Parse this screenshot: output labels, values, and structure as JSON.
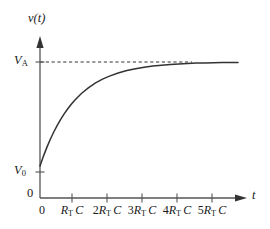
{
  "figure": {
    "background_color": "#ffffff",
    "line_color": "#333333",
    "text_color": "#1a1a1a"
  },
  "axes": {
    "y_axis_label": "v(t)",
    "x_axis_label": "t",
    "y_axis_name": "y-axis",
    "x_axis_name": "x-axis",
    "origin_label": "0",
    "origin_label_x": "0"
  },
  "y_ticks": [
    {
      "label_base": "V",
      "label_sub": "A",
      "value": "V_A"
    },
    {
      "label_base": "V",
      "label_sub": "0",
      "value": "V_0"
    }
  ],
  "x_ticks": [
    {
      "coef": "",
      "base": "R",
      "sub": "T",
      "unit": "C",
      "label": "R_T C"
    },
    {
      "coef": "2",
      "base": "R",
      "sub": "T",
      "unit": "C",
      "label": "2R_T C"
    },
    {
      "coef": "3",
      "base": "R",
      "sub": "T",
      "unit": "C",
      "label": "3R_T C"
    },
    {
      "coef": "4",
      "base": "R",
      "sub": "T",
      "unit": "C",
      "label": "4R_T C"
    },
    {
      "coef": "5",
      "base": "R",
      "sub": "T",
      "unit": "C",
      "label": "5R_T C"
    }
  ],
  "chart_data": {
    "type": "line",
    "title": "",
    "subtitle": "",
    "xlabel": "t",
    "ylabel": "v(t)",
    "xlim": [
      0,
      5.7
    ],
    "ylim": [
      0,
      1.22
    ],
    "grid": false,
    "legend": null,
    "x_tick_values": [
      0,
      1,
      2,
      3,
      4,
      5
    ],
    "x_tick_labels": [
      "0",
      "R_T C",
      "2R_T C",
      "3R_T C",
      "4R_T C",
      "5R_T C"
    ],
    "y_tick_values": [
      0,
      0.235,
      1.0
    ],
    "y_tick_labels": [
      "0",
      "V_0",
      "V_A"
    ],
    "annotations": [
      {
        "name": "asymptote",
        "type": "dashed-horizontal-line",
        "y": 1.0,
        "x_start": 0,
        "x_end": 4.3,
        "label": "V_A"
      }
    ],
    "series": [
      {
        "name": "v(t) = V_A + (V_0 - V_A) e^(-t / R_T C)",
        "style": "solid",
        "color": "#333333",
        "x": [
          0,
          0.1,
          0.2,
          0.3,
          0.4,
          0.5,
          0.6,
          0.7,
          0.8,
          0.9,
          1.0,
          1.2,
          1.4,
          1.6,
          1.8,
          2.0,
          2.25,
          2.5,
          2.75,
          3.0,
          3.25,
          3.5,
          3.75,
          4.0,
          4.25,
          4.5,
          4.75,
          5.0,
          5.25,
          5.5,
          5.7
        ],
        "y": [
          0.235,
          0.308,
          0.374,
          0.434,
          0.487,
          0.536,
          0.58,
          0.62,
          0.656,
          0.689,
          0.719,
          0.77,
          0.812,
          0.846,
          0.874,
          0.896,
          0.919,
          0.937,
          0.951,
          0.962,
          0.97,
          0.977,
          0.982,
          0.986,
          0.989,
          0.992,
          0.993,
          0.995,
          0.996,
          0.997,
          0.997
        ]
      }
    ]
  }
}
